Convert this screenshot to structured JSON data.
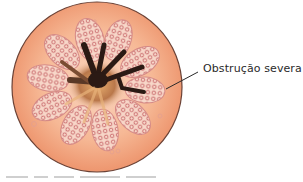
{
  "figure": {
    "annotations": [
      {
        "label": "Obstrução severa",
        "target": "airway-wall"
      }
    ],
    "colors": {
      "outer_wall": "#f2a07a",
      "outer_wall_light": "#f7c3a4",
      "mucosa_fold": "#f6cfc0",
      "fold_cells": "#c0605a",
      "lumen": "#2b1a14",
      "lumen_glow": "#e2a566",
      "outline": "#5a3a30"
    }
  }
}
